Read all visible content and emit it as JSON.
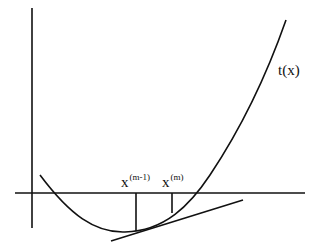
{
  "diagram": {
    "function_label": "t(x)",
    "labels": {
      "x_prev_base": "x",
      "x_prev_sup": "(m-1)",
      "x_curr_base": "x",
      "x_curr_sup": "(m)"
    },
    "colors": {
      "stroke": "#111111",
      "background": "#ffffff"
    }
  }
}
